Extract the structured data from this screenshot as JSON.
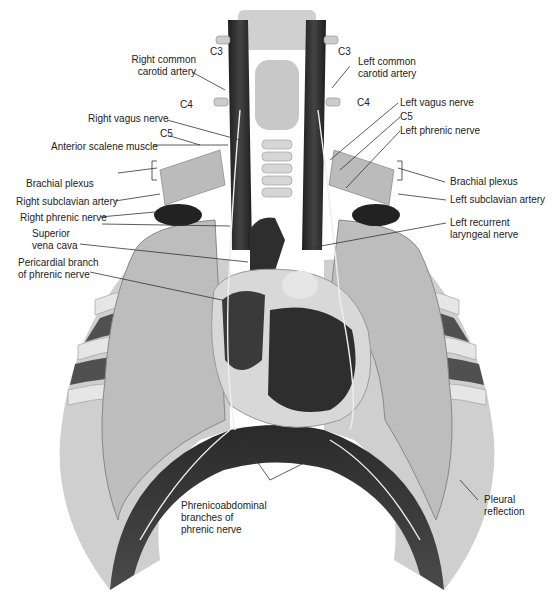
{
  "figure": {
    "colors": {
      "background": "#ffffff",
      "label_text": "#222222",
      "leader_line": "#333333",
      "muscle_dark": "#2b2b2b",
      "lung": "#bdbdbd",
      "rib": "#d9d9d9",
      "heart": "#3a3a3a"
    }
  },
  "labels": {
    "c3_right": "C3",
    "c3_left": "C3",
    "right_common_carotid": "Right common\ncarotid artery",
    "left_common_carotid": "Left common\ncarotid artery",
    "c4_right": "C4",
    "c4_left": "C4",
    "right_vagus": "Right vagus nerve",
    "left_vagus": "Left vagus nerve",
    "c5_right": "C5",
    "c5_left": "C5",
    "left_phrenic": "Left phrenic nerve",
    "anterior_scalene": "Anterior scalene muscle",
    "brachial_plexus_right": "Brachial plexus",
    "brachial_plexus_left": "Brachial plexus",
    "right_subclavian": "Right subclavian artery",
    "left_subclavian": "Left subclavian artery",
    "right_phrenic": "Right phrenic nerve",
    "superior_vena_cava": "Superior\nvena cava",
    "left_recurrent_laryngeal": "Left recurrent\nlaryngeal nerve",
    "pericardial_branch": "Pericardial branch\nof phrenic nerve",
    "phrenicoabdominal": "Phrenicoabdominal\nbranches of\nphrenic nerve",
    "pleural_reflection": "Pleural\nreflection"
  }
}
